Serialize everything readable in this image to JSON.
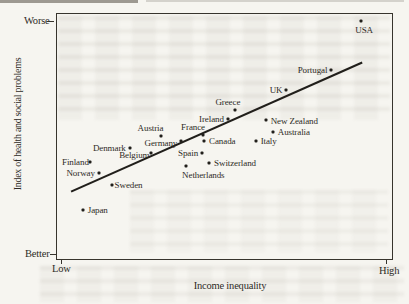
{
  "page": {
    "paper_color": "#f6f5f0",
    "ink_color": "#2e2b26"
  },
  "chart_data": {
    "type": "scatter",
    "title": "",
    "xlabel": "Income inequality",
    "ylabel": "Index of health and social problems",
    "x_axis": {
      "min_label": "Low",
      "max_label": "High",
      "scale": "qualitative"
    },
    "y_axis": {
      "min_label": "Better",
      "max_label": "Worse",
      "scale": "qualitative"
    },
    "grid": false,
    "legend": false,
    "coords_note": "x_pct measured from left axis (Low to High); y_pct measured from top of plot (Worse at top, Better at bottom)",
    "trend_line": {
      "x1_pct": 4.2,
      "y1_pct": 72.5,
      "x2_pct": 91.1,
      "y2_pct": 19.8
    },
    "points": [
      {
        "name": "USA",
        "x_pct": 90.8,
        "y_pct": 2.8,
        "label_side": "below",
        "dx": 3,
        "dy": 0
      },
      {
        "name": "Portugal",
        "x_pct": 81.9,
        "y_pct": 22.7,
        "label_side": "left",
        "dx": 0,
        "dy": 0
      },
      {
        "name": "UK",
        "x_pct": 68.5,
        "y_pct": 31.2,
        "label_side": "left",
        "dx": 0,
        "dy": 0
      },
      {
        "name": "Greece",
        "x_pct": 53.1,
        "y_pct": 39.3,
        "label_side": "above",
        "dx": -7,
        "dy": 0
      },
      {
        "name": "New Zealand",
        "x_pct": 62.3,
        "y_pct": 43.3,
        "label_side": "right",
        "dx": 0,
        "dy": 1
      },
      {
        "name": "Ireland",
        "x_pct": 51.0,
        "y_pct": 42.9,
        "label_side": "left",
        "dx": 0,
        "dy": 0
      },
      {
        "name": "Australia",
        "x_pct": 64.4,
        "y_pct": 48.2,
        "label_side": "right",
        "dx": 0,
        "dy": 0
      },
      {
        "name": "France",
        "x_pct": 43.6,
        "y_pct": 49.4,
        "label_side": "above",
        "dx": -10,
        "dy": 0
      },
      {
        "name": "Austria",
        "x_pct": 30.9,
        "y_pct": 49.8,
        "label_side": "above",
        "dx": -10,
        "dy": 0
      },
      {
        "name": "Canada",
        "x_pct": 43.9,
        "y_pct": 51.8,
        "label_side": "right",
        "dx": 0,
        "dy": 0
      },
      {
        "name": "Germany",
        "x_pct": 37.1,
        "y_pct": 51.8,
        "label_side": "left",
        "dx": 0,
        "dy": 2
      },
      {
        "name": "Italy",
        "x_pct": 59.3,
        "y_pct": 51.8,
        "label_side": "right",
        "dx": 0,
        "dy": 0
      },
      {
        "name": "Denmark",
        "x_pct": 21.7,
        "y_pct": 54.7,
        "label_side": "left",
        "dx": 0,
        "dy": 0
      },
      {
        "name": "Belgium",
        "x_pct": 28.2,
        "y_pct": 56.7,
        "label_side": "left",
        "dx": 2,
        "dy": 2
      },
      {
        "name": "Spain",
        "x_pct": 43.3,
        "y_pct": 56.7,
        "label_side": "left",
        "dx": 0,
        "dy": 0
      },
      {
        "name": "Finland",
        "x_pct": 9.8,
        "y_pct": 60.3,
        "label_side": "left",
        "dx": 3,
        "dy": 0
      },
      {
        "name": "Switzerland",
        "x_pct": 45.4,
        "y_pct": 60.7,
        "label_side": "right",
        "dx": 0,
        "dy": 0
      },
      {
        "name": "Netherlands",
        "x_pct": 38.6,
        "y_pct": 61.9,
        "label_side": "below",
        "dx": 17,
        "dy": 0
      },
      {
        "name": "Norway",
        "x_pct": 12.5,
        "y_pct": 64.8,
        "label_side": "left",
        "dx": 0,
        "dy": 0
      },
      {
        "name": "Sweden",
        "x_pct": 16.3,
        "y_pct": 69.6,
        "label_side": "right",
        "dx": -2,
        "dy": 0
      },
      {
        "name": "Japan",
        "x_pct": 7.7,
        "y_pct": 79.8,
        "label_side": "right",
        "dx": 0,
        "dy": 0
      }
    ]
  }
}
